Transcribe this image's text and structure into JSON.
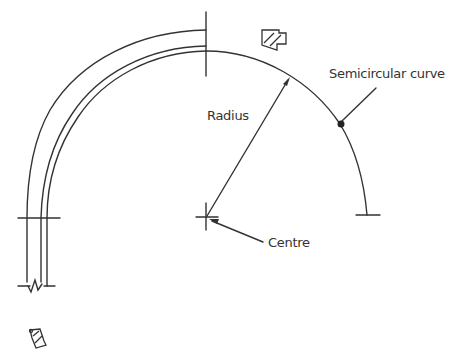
{
  "diagram": {
    "type": "geometry-semicircular-curve",
    "labels": {
      "semicircular_curve": "Semicircular curve",
      "radius": "Radius",
      "centre": "Centre"
    },
    "colors": {
      "line": "#333333",
      "background": "#ffffff"
    },
    "icons": [
      "hatched-block-symbol",
      "hatched-wedge-symbol"
    ]
  }
}
